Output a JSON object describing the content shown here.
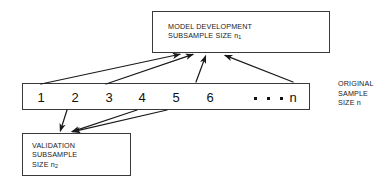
{
  "diagram": {
    "model_box": {
      "line1": "MODEL DEVELOPMENT",
      "line2_prefix": "SUBSAMPLE SIZE n",
      "line2_subscript": "1"
    },
    "sample_bar": {
      "cells": [
        "1",
        "2",
        "3",
        "4",
        "5",
        "6"
      ],
      "ellipsis": "· · ·",
      "last_cell": "n"
    },
    "validation_box": {
      "line1": "VALIDATION",
      "line2": "SUBSAMPLE",
      "line3_prefix": "SIZE n",
      "line3_subscript": "2"
    },
    "original_caption": {
      "line1": "ORIGINAL",
      "line2": "SAMPLE",
      "line3": "SIZE n"
    },
    "arrows": {
      "to_model": [
        {
          "from_label": "1",
          "x1": 41,
          "y1": 84,
          "x2": 181,
          "y2": 54
        },
        {
          "from_label": "3",
          "x1": 106,
          "y1": 84,
          "x2": 194,
          "y2": 54
        },
        {
          "from_label": "6",
          "x1": 196,
          "y1": 82,
          "x2": 206,
          "y2": 55
        },
        {
          "from_label": "n",
          "x1": 293,
          "y1": 82,
          "x2": 224,
          "y2": 55
        }
      ],
      "to_validation": [
        {
          "from_label": "2",
          "x1": 67,
          "y1": 110,
          "x2": 60,
          "y2": 132
        },
        {
          "from_label": "4",
          "x1": 137,
          "y1": 110,
          "x2": 71,
          "y2": 132
        },
        {
          "from_label": "5",
          "x1": 167,
          "y1": 110,
          "x2": 72,
          "y2": 132
        }
      ]
    },
    "colors": {
      "stroke": "#3a3a3a",
      "arrow": "#1a1a1a",
      "text": "#1a1a1a",
      "background": "#ffffff"
    }
  }
}
